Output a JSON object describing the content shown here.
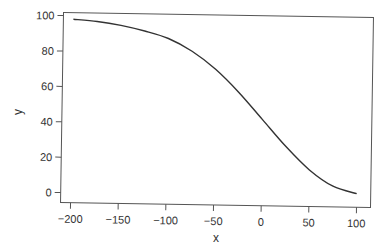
{
  "chart_data": {
    "type": "line",
    "title": "",
    "xlabel": "x",
    "ylabel": "y",
    "xlim": [
      -210,
      105
    ],
    "ylim": [
      -3,
      101
    ],
    "x_ticks": [
      -200,
      -150,
      -100,
      -50,
      0,
      50,
      100
    ],
    "y_ticks": [
      0,
      20,
      40,
      60,
      80,
      100
    ],
    "grid": false,
    "legend": null,
    "series": [
      {
        "name": "y",
        "color": "#333333",
        "x": [
          -200,
          -175,
          -150,
          -125,
          -100,
          -75,
          -50,
          -25,
          0,
          25,
          50,
          75,
          100
        ],
        "y": [
          98,
          97,
          95,
          92,
          88,
          81,
          71,
          58,
          43,
          28,
          15,
          6,
          2
        ]
      }
    ]
  }
}
